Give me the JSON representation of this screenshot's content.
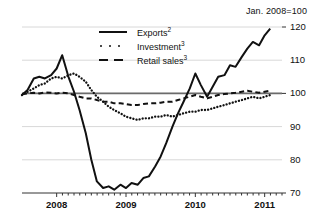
{
  "chart_data": {
    "type": "line",
    "title": "",
    "subtitle": "",
    "unit_note": "Jan. 2008=100",
    "xlabel": "",
    "ylabel": "",
    "ylim": [
      70,
      120
    ],
    "yticks": [
      70,
      80,
      90,
      100,
      110,
      120
    ],
    "ytick_labels": [
      "70",
      "80",
      "90",
      "100",
      "110",
      "120"
    ],
    "xticks": [
      2008,
      2009,
      2010,
      2011
    ],
    "xtick_labels": [
      "2008",
      "2009",
      "2010",
      "2011"
    ],
    "x_minor_ticks": "monthly",
    "xlim": [
      2007.5,
      2011.25
    ],
    "grid": true,
    "gridlines_at": [
      80,
      90,
      100,
      110,
      120
    ],
    "baseline_at": 100,
    "legend_position": "top-center",
    "series": [
      {
        "name": "Exports",
        "footnote": "2",
        "style": "solid",
        "x": [
          2007.5,
          2007.58,
          2007.67,
          2007.75,
          2007.83,
          2007.92,
          2008.0,
          2008.08,
          2008.17,
          2008.25,
          2008.33,
          2008.42,
          2008.5,
          2008.58,
          2008.67,
          2008.75,
          2008.83,
          2008.92,
          2009.0,
          2009.08,
          2009.17,
          2009.25,
          2009.33,
          2009.42,
          2009.5,
          2009.58,
          2009.67,
          2009.75,
          2009.83,
          2009.92,
          2010.0,
          2010.08,
          2010.17,
          2010.25,
          2010.33,
          2010.42,
          2010.5,
          2010.58,
          2010.67,
          2010.75,
          2010.83,
          2010.92,
          2011.0,
          2011.08
        ],
        "values": [
          99.5,
          101.0,
          104.5,
          105.0,
          104.5,
          105.5,
          107.5,
          111.5,
          105.0,
          100.5,
          95.0,
          88.0,
          80.0,
          73.5,
          71.5,
          72.0,
          71.0,
          72.5,
          71.5,
          73.0,
          72.5,
          74.5,
          75.0,
          78.0,
          81.0,
          85.0,
          90.0,
          94.0,
          97.5,
          101.5,
          106.0,
          102.5,
          99.0,
          102.0,
          105.0,
          105.5,
          108.5,
          108.0,
          111.0,
          113.5,
          115.5,
          114.5,
          117.5,
          119.5
        ]
      },
      {
        "name": "Investment",
        "footnote": "3",
        "style": "dotted",
        "x": [
          2007.5,
          2007.58,
          2007.67,
          2007.75,
          2007.83,
          2007.92,
          2008.0,
          2008.08,
          2008.17,
          2008.25,
          2008.33,
          2008.42,
          2008.5,
          2008.58,
          2008.67,
          2008.75,
          2008.83,
          2008.92,
          2009.0,
          2009.08,
          2009.17,
          2009.25,
          2009.33,
          2009.42,
          2009.5,
          2009.58,
          2009.67,
          2009.75,
          2009.83,
          2009.92,
          2010.0,
          2010.08,
          2010.17,
          2010.25,
          2010.33,
          2010.42,
          2010.5,
          2010.58,
          2010.67,
          2010.75,
          2010.83,
          2010.92,
          2011.0,
          2011.08
        ],
        "values": [
          99.5,
          100.5,
          101.5,
          102.5,
          103.0,
          104.5,
          105.0,
          104.5,
          105.5,
          106.0,
          105.0,
          103.5,
          101.0,
          99.0,
          97.5,
          96.0,
          95.0,
          94.0,
          93.0,
          92.5,
          92.0,
          92.5,
          92.5,
          93.0,
          93.0,
          93.5,
          93.0,
          93.5,
          94.0,
          94.5,
          94.5,
          95.0,
          95.0,
          95.5,
          96.0,
          96.5,
          97.0,
          97.5,
          98.0,
          98.5,
          99.0,
          98.5,
          99.0,
          99.5
        ]
      },
      {
        "name": "Retail sales",
        "footnote": "3",
        "style": "dashed",
        "x": [
          2007.5,
          2007.58,
          2007.67,
          2007.75,
          2007.83,
          2007.92,
          2008.0,
          2008.08,
          2008.17,
          2008.25,
          2008.33,
          2008.42,
          2008.5,
          2008.58,
          2008.67,
          2008.75,
          2008.83,
          2008.92,
          2009.0,
          2009.08,
          2009.17,
          2009.25,
          2009.33,
          2009.42,
          2009.5,
          2009.58,
          2009.67,
          2009.75,
          2009.83,
          2009.92,
          2010.0,
          2010.08,
          2010.17,
          2010.25,
          2010.33,
          2010.42,
          2010.5,
          2010.58,
          2010.67,
          2010.75,
          2010.83,
          2010.92,
          2011.0,
          2011.08
        ],
        "values": [
          99.8,
          100.0,
          100.2,
          100.0,
          100.3,
          100.2,
          100.0,
          100.2,
          100.0,
          99.5,
          99.0,
          98.5,
          98.5,
          98.0,
          97.5,
          97.5,
          97.0,
          97.0,
          96.8,
          96.5,
          96.5,
          96.8,
          97.0,
          97.0,
          97.2,
          97.5,
          97.5,
          98.0,
          98.5,
          99.0,
          99.5,
          99.0,
          98.5,
          99.0,
          99.5,
          99.8,
          100.0,
          100.2,
          100.5,
          100.8,
          100.5,
          100.2,
          100.5,
          100.8
        ]
      }
    ]
  },
  "legend": {
    "items": [
      {
        "label": "Exports",
        "sup": "2",
        "key": "solid-line-key"
      },
      {
        "label": "Investment",
        "sup": "3",
        "key": "dotted-line-key"
      },
      {
        "label": "Retail sales",
        "sup": "3",
        "key": "dashed-line-key"
      }
    ]
  }
}
